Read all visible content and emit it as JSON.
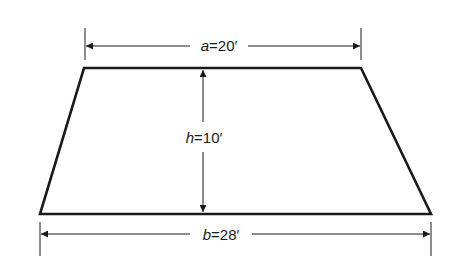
{
  "diagram": {
    "type": "trapezoid",
    "stroke_color": "#1a1a1a",
    "background": "#ffffff",
    "top_dimension": {
      "variable": "a",
      "equals": "=",
      "value": "20′"
    },
    "height_dimension": {
      "variable": "h",
      "equals": "=",
      "value": "10′"
    },
    "bottom_dimension": {
      "variable": "b",
      "equals": "=",
      "value": "28′"
    }
  }
}
